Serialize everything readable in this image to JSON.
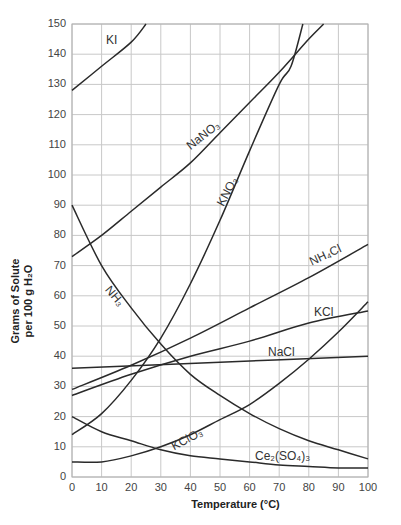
{
  "chart_data": {
    "type": "line",
    "title": "",
    "xlabel": "Temperature (°C)",
    "ylabel": "Grams of Solute per 100 g H2O",
    "xlim": [
      0,
      100
    ],
    "ylim": [
      0,
      150
    ],
    "grid": true,
    "legend": "inline labels on curves",
    "x_ticks": [
      "0",
      "10",
      "20",
      "30",
      "40",
      "50",
      "60",
      "70",
      "80",
      "90",
      "100"
    ],
    "y_ticks": [
      "0",
      "10",
      "20",
      "30",
      "40",
      "50",
      "60",
      "70",
      "80",
      "90",
      "100",
      "110",
      "120",
      "130",
      "140",
      "150"
    ],
    "series": [
      {
        "name": "KI",
        "x": [
          0,
          10,
          20,
          25
        ],
        "y": [
          128,
          136,
          144,
          150
        ]
      },
      {
        "name": "NaNO3",
        "x": [
          0,
          10,
          20,
          30,
          40,
          50,
          60,
          70,
          80,
          85
        ],
        "y": [
          73,
          80,
          88,
          96,
          104,
          114,
          124,
          134,
          145,
          150
        ]
      },
      {
        "name": "KNO3",
        "x": [
          0,
          10,
          20,
          30,
          40,
          50,
          60,
          70,
          74,
          78
        ],
        "y": [
          14,
          21,
          32,
          46,
          64,
          85,
          108,
          130,
          136,
          150
        ]
      },
      {
        "name": "NH3",
        "x": [
          0,
          10,
          20,
          30,
          40,
          50,
          60,
          70,
          80,
          90,
          100
        ],
        "y": [
          90,
          70,
          56,
          44,
          34,
          27,
          21,
          16,
          12,
          9,
          6
        ]
      },
      {
        "name": "NH4Cl",
        "x": [
          0,
          20,
          40,
          60,
          80,
          100
        ],
        "y": [
          29,
          37,
          46,
          56,
          66,
          77
        ]
      },
      {
        "name": "KCl",
        "x": [
          0,
          20,
          40,
          60,
          80,
          100
        ],
        "y": [
          27,
          34,
          40,
          45,
          51,
          55
        ]
      },
      {
        "name": "NaCl",
        "x": [
          0,
          50,
          100
        ],
        "y": [
          36,
          38,
          40
        ]
      },
      {
        "name": "KClO3",
        "x": [
          0,
          10,
          20,
          30,
          40,
          50,
          60,
          70,
          80,
          90,
          100
        ],
        "y": [
          5,
          5,
          7,
          10,
          14,
          19,
          24,
          31,
          39,
          48,
          58
        ]
      },
      {
        "name": "Ce2(SO4)3",
        "x": [
          0,
          10,
          20,
          30,
          40,
          50,
          60,
          70,
          80,
          90,
          100
        ],
        "y": [
          20,
          15,
          12,
          9,
          7,
          6,
          5,
          4,
          3.5,
          3,
          3
        ]
      }
    ]
  },
  "labels": {
    "KI": "KI",
    "NaNO3": "NaNO₃",
    "KNO3": "KNO₃",
    "NH3": "NH₃",
    "NH4Cl": "NH₄Cl",
    "KCl": "KCl",
    "NaCl": "NaCl",
    "KClO3": "KClO₃",
    "Ce2SO43": "Ce₂(SO₄)₃"
  },
  "axes": {
    "x_title": "Temperature (°C)",
    "y_title_line1": "Grams of Solute",
    "y_title_line2": "per 100 g H₂O"
  },
  "ticks": {
    "y": [
      "150",
      "140",
      "130",
      "120",
      "110",
      "100",
      "90",
      "80",
      "70",
      "60",
      "50",
      "40",
      "30",
      "20",
      "10",
      "0"
    ],
    "x": [
      "0",
      "10",
      "20",
      "30",
      "40",
      "50",
      "60",
      "70",
      "80",
      "90",
      "100"
    ]
  },
  "colors": {
    "grid": "#c8c8c8",
    "curve": "#2a2a2a",
    "text": "#333333"
  }
}
